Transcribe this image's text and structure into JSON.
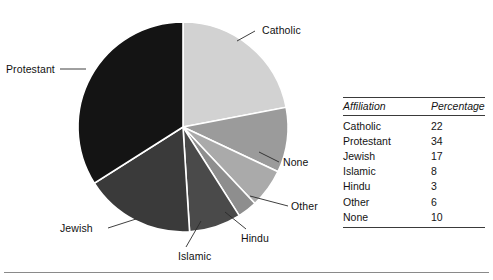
{
  "chart_data": {
    "type": "pie",
    "title": "",
    "subtitle": "",
    "xlabel": "",
    "ylabel": "",
    "grid": false,
    "legend": "callout-labels",
    "units": "percent",
    "start_angle_deg": 0,
    "direction": "clockwise",
    "categories": [
      "Catholic",
      "None",
      "Other",
      "Hindu",
      "Islamic",
      "Jewish",
      "Protestant"
    ],
    "values": [
      22,
      10,
      6,
      3,
      8,
      17,
      34
    ],
    "slices": [
      {
        "label": "Catholic",
        "value": 22,
        "color": "#d2d2d2"
      },
      {
        "label": "None",
        "value": 10,
        "color": "#9b9b9b"
      },
      {
        "label": "Other",
        "value": 6,
        "color": "#aaaaaa"
      },
      {
        "label": "Hindu",
        "value": 3,
        "color": "#8e8e8e"
      },
      {
        "label": "Islamic",
        "value": 8,
        "color": "#4a4a4a"
      },
      {
        "label": "Jewish",
        "value": 17,
        "color": "#3a3a3a"
      },
      {
        "label": "Protestant",
        "value": 34,
        "color": "#141414"
      }
    ],
    "separator_color": "#ffffff",
    "table": {
      "columns": [
        "Affiliation",
        "Percentage"
      ],
      "rows": [
        [
          "Catholic",
          "22"
        ],
        [
          "Protestant",
          "34"
        ],
        [
          "Jewish",
          "17"
        ],
        [
          "Islamic",
          "8"
        ],
        [
          "Hindu",
          "3"
        ],
        [
          "Other",
          "6"
        ],
        [
          "None",
          "10"
        ]
      ]
    }
  },
  "labels": {
    "catholic": "Catholic",
    "protestant": "Protestant",
    "none": "None",
    "other": "Other",
    "hindu": "Hindu",
    "islamic": "Islamic",
    "jewish": "Jewish"
  },
  "table": {
    "header_affiliation": "Affiliation",
    "header_percentage": "Percentage",
    "rows": [
      {
        "affiliation": "Catholic",
        "percentage": "22"
      },
      {
        "affiliation": "Protestant",
        "percentage": "34"
      },
      {
        "affiliation": "Jewish",
        "percentage": "17"
      },
      {
        "affiliation": "Islamic",
        "percentage": "8"
      },
      {
        "affiliation": "Hindu",
        "percentage": "3"
      },
      {
        "affiliation": "Other",
        "percentage": "6"
      },
      {
        "affiliation": "None",
        "percentage": "10"
      }
    ]
  }
}
